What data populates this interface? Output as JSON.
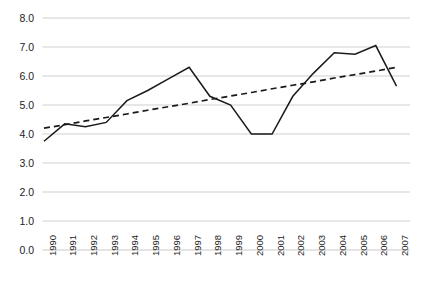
{
  "chart_data": {
    "type": "line",
    "title": "",
    "subtitle": "",
    "xlabel": "",
    "ylabel": "",
    "grid": true,
    "grid_axis": "y",
    "legend": "none",
    "xlim_categories_first": "1990",
    "xlim_categories_last": "2007",
    "ylim": [
      0.0,
      8.0
    ],
    "ystep": 1.0,
    "ytick_labels": [
      "8.0",
      "7.0",
      "6.0",
      "5.0",
      "4.0",
      "3.0",
      "2.0",
      "1.0",
      "0.0"
    ],
    "ytick_values": [
      8.0,
      7.0,
      6.0,
      5.0,
      4.0,
      3.0,
      2.0,
      1.0,
      0.0
    ],
    "categories": [
      "1990",
      "1991",
      "1992",
      "1993",
      "1994",
      "1995",
      "1996",
      "1997",
      "1998",
      "1999",
      "2000",
      "2001",
      "2002",
      "2003",
      "2004",
      "2005",
      "2006",
      "2007"
    ],
    "series": [
      {
        "name": "data-line",
        "style": "solid",
        "color": "#1a1a1a",
        "values": [
          3.75,
          4.35,
          4.25,
          4.4,
          5.15,
          5.5,
          5.9,
          6.3,
          5.3,
          5.0,
          4.0,
          4.0,
          5.3,
          6.1,
          6.8,
          6.75,
          7.05,
          5.65
        ]
      },
      {
        "name": "trend-line",
        "style": "dashed",
        "color": "#1a1a1a",
        "values": [
          4.2,
          4.32,
          4.45,
          4.57,
          4.69,
          4.82,
          4.94,
          5.06,
          5.19,
          5.31,
          5.43,
          5.56,
          5.68,
          5.8,
          5.93,
          6.05,
          6.17,
          6.3
        ]
      }
    ]
  },
  "colors": {
    "line": "#1a1a1a",
    "grid": "#c9c9c9",
    "axis_text": "#222222",
    "background": "#ffffff"
  }
}
